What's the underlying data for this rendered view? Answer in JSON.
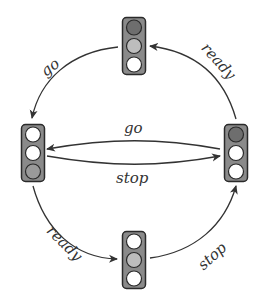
{
  "diagram": {
    "type": "state-machine",
    "title": "",
    "colors": {
      "housing_fill": "#8a8a8a",
      "housing_stroke": "#2a2a2a",
      "lamp_off": "#ffffff",
      "lamp_red_on": "#6e6e6e",
      "lamp_yellow_on": "#bdbdbd",
      "lamp_green_on": "#9a9a9a",
      "lamp_stroke": "#2a2a2a",
      "edge": "#333333"
    },
    "nodes": [
      {
        "id": "top",
        "name": "ready-to-go state",
        "lamps": {
          "red": true,
          "yellow": true,
          "green": false
        },
        "x": 122,
        "y": 17
      },
      {
        "id": "left",
        "name": "go state",
        "lamps": {
          "red": false,
          "yellow": false,
          "green": true
        },
        "x": 21,
        "y": 124
      },
      {
        "id": "right",
        "name": "stop state",
        "lamps": {
          "red": true,
          "yellow": false,
          "green": false
        },
        "x": 224,
        "y": 124
      },
      {
        "id": "bottom",
        "name": "ready-to-stop state",
        "lamps": {
          "red": false,
          "yellow": true,
          "green": false
        },
        "x": 122,
        "y": 231
      }
    ],
    "edges": [
      {
        "from": "top",
        "to": "left",
        "label": "go"
      },
      {
        "from": "right",
        "to": "top",
        "label": "ready"
      },
      {
        "from": "right",
        "to": "left",
        "label": "go"
      },
      {
        "from": "left",
        "to": "right",
        "label": "stop"
      },
      {
        "from": "left",
        "to": "bottom",
        "label": "ready"
      },
      {
        "from": "bottom",
        "to": "right",
        "label": "stop"
      }
    ]
  }
}
